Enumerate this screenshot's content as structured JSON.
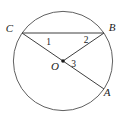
{
  "diagram": {
    "type": "geometry-circle-figure",
    "point_labels": {
      "center": "O",
      "top_left": "C",
      "top_right": "B",
      "bottom_right": "A"
    },
    "angle_labels": {
      "at_C": "1",
      "at_B": "2",
      "at_O": "3"
    },
    "colors": {
      "background": "#ffffff",
      "circle_stroke": "#606060",
      "line_stroke": "#3f3f3f",
      "text": "#1a1a1a"
    }
  }
}
